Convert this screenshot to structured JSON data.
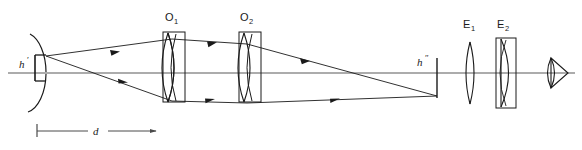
{
  "figure": {
    "background_color": "#ffffff",
    "stroke_color": "#1a1a1a",
    "axis_color": "#4a4a4a",
    "width": 582,
    "height": 150
  },
  "labels": {
    "objective_1": {
      "text": "O",
      "subscript": "1"
    },
    "objective_2": {
      "text": "O",
      "subscript": "2"
    },
    "eyepiece_1": {
      "text": "E",
      "subscript": "1"
    },
    "eyepiece_2": {
      "text": "E",
      "subscript": "2"
    },
    "object_height": {
      "text": "h",
      "prime": "′"
    },
    "image_height": {
      "text": "h",
      "prime": "″"
    },
    "distance": {
      "text": "d"
    }
  },
  "components": [
    {
      "name": "object-arc",
      "kind": "curved-object",
      "x": 28,
      "label": "h'"
    },
    {
      "name": "object-arrow",
      "kind": "object-arrow",
      "x": 34,
      "label": "h'"
    },
    {
      "name": "lens-o1",
      "kind": "biconvex-lens-in-housing",
      "x": 172,
      "label": "O1"
    },
    {
      "name": "lens-o2",
      "kind": "biconvex-lens-in-housing",
      "x": 247,
      "label": "O2"
    },
    {
      "name": "image-arrow",
      "kind": "inverted-image-arrow",
      "x": 437,
      "label": "h\""
    },
    {
      "name": "lens-e1",
      "kind": "biconvex-lens",
      "x": 470,
      "label": "E1"
    },
    {
      "name": "lens-e2",
      "kind": "plano-convex-lens-in-housing",
      "x": 503,
      "label": "E2"
    },
    {
      "name": "eye-symbol",
      "kind": "eye",
      "x": 556
    }
  ],
  "dimension": {
    "name": "distance-d",
    "label": "d",
    "from_x": 36,
    "to_x": 163,
    "y": 131
  },
  "rays": {
    "count": 2,
    "description": "Two marginal rays from the object tip pass through objectives O1 and O2 and converge to form an inverted intermediate image h\"",
    "arrow_markers": 6
  },
  "optical_axis": {
    "y": 73,
    "from_x": 8,
    "to_x": 575
  }
}
